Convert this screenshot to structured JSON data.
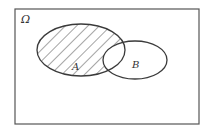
{
  "diagram": {
    "type": "venn",
    "universe_label": "Ω",
    "sets": [
      {
        "name": "A",
        "label": "A"
      },
      {
        "name": "B",
        "label": "B"
      }
    ],
    "shaded_region": "A \\ B (A minus B)",
    "colors": {
      "stroke": "#3a3a3a",
      "hatch": "#4a4a4a",
      "background": "#ffffff"
    }
  }
}
